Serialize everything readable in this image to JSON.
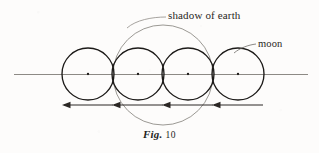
{
  "figure": {
    "caption_prefix": "Fig.",
    "caption_number": "10",
    "labels": {
      "shadow": "shadow of earth",
      "moon": "moon"
    },
    "colors": {
      "ink": "#2a2724",
      "moon_stroke": "#1c1a18",
      "shadow_stroke": "#8a8782",
      "axis_stroke": "#8d8a85",
      "arrow_stroke": "#2b2724",
      "paper": "#fdfcfb"
    },
    "geometry": {
      "axis_y": 74,
      "axis_x_start": 14,
      "axis_x_end": 308,
      "moon_radius": 26,
      "moon_centers_x": [
        88,
        138,
        188,
        238
      ],
      "shadow_circle": {
        "cx": 163,
        "cy": 75,
        "r": 50
      },
      "arrows_y": 105,
      "arrow_spans": [
        {
          "tail_x": 113,
          "head_x": 62
        },
        {
          "tail_x": 163,
          "head_x": 112
        },
        {
          "tail_x": 213,
          "head_x": 162
        },
        {
          "tail_x": 263,
          "head_x": 212
        }
      ]
    }
  }
}
